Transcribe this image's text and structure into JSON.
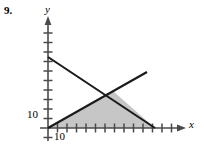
{
  "figure": {
    "problem_number": "9.",
    "axis_labels": {
      "x": "x",
      "y": "y"
    },
    "tick_labels": {
      "x_first": "10",
      "y_first": "10"
    },
    "colors": {
      "line": "#1a1a1a",
      "axis": "#4a4a4a",
      "shade": "#c6c6c6",
      "background": "#ffffff"
    }
  },
  "chart_data": {
    "type": "line",
    "title": "",
    "xlabel": "x",
    "ylabel": "y",
    "grid": false,
    "legend": null,
    "xlim": [
      0,
      140
    ],
    "ylim": [
      0,
      110
    ],
    "xticks": [
      10,
      20,
      30,
      40,
      50,
      60,
      70,
      80,
      90,
      100,
      110,
      120,
      130,
      140
    ],
    "yticks": [
      10,
      20,
      30,
      40,
      50,
      60,
      70,
      80,
      90,
      100
    ],
    "xtick_labels": [
      "10"
    ],
    "ytick_labels": [
      "10"
    ],
    "series": [
      {
        "name": "descending-line",
        "x": [
          0,
          110
        ],
        "y": [
          70,
          0
        ],
        "points_px": [
          [
            48,
            57
          ],
          [
            155,
            128
          ]
        ]
      },
      {
        "name": "ascending-line",
        "x": [
          0,
          102
        ],
        "y": [
          0,
          56
        ],
        "points_px": [
          [
            48,
            128
          ],
          [
            147,
            72
          ]
        ]
      }
    ],
    "shaded_region": {
      "name": "feasible-region",
      "vertices": [
        [
          0,
          0
        ],
        [
          67,
          37
        ],
        [
          110,
          0
        ]
      ],
      "vertices_px": [
        [
          48,
          128
        ],
        [
          113,
          91
        ],
        [
          155,
          128
        ]
      ],
      "fill": "#c6c6c6"
    },
    "annotations": [
      {
        "text": "9.",
        "role": "problem-number"
      }
    ]
  }
}
